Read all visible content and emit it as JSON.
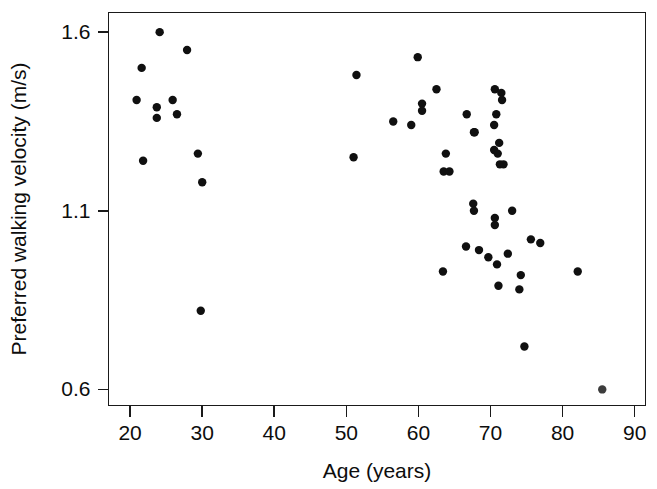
{
  "chart_data": {
    "type": "scatter",
    "title": "",
    "xlabel": "Age (years)",
    "ylabel": "Preferred walking velocity (m/s)",
    "xlim": [
      17.0,
      91.5
    ],
    "ylim": [
      0.555,
      1.655
    ],
    "xticks": [
      20,
      30,
      40,
      50,
      60,
      70,
      80,
      90
    ],
    "xticklabels": [
      "20",
      "30",
      "40",
      "50",
      "60",
      "70",
      "80",
      "90"
    ],
    "yticks": [
      0.6,
      1.1,
      1.6
    ],
    "yticklabels": [
      "0.6",
      "1.1",
      "1.6"
    ],
    "grid": false,
    "legend": null,
    "marker": "filled-circle",
    "marker_color": "#101010",
    "n_points": 55,
    "points": [
      {
        "x": 24.1,
        "y": 1.6
      },
      {
        "x": 27.9,
        "y": 1.55
      },
      {
        "x": 21.6,
        "y": 1.5
      },
      {
        "x": 20.9,
        "y": 1.41
      },
      {
        "x": 23.7,
        "y": 1.39
      },
      {
        "x": 25.9,
        "y": 1.41
      },
      {
        "x": 23.7,
        "y": 1.36
      },
      {
        "x": 26.5,
        "y": 1.37
      },
      {
        "x": 29.4,
        "y": 1.26
      },
      {
        "x": 21.8,
        "y": 1.24
      },
      {
        "x": 30.0,
        "y": 1.18
      },
      {
        "x": 29.8,
        "y": 0.82
      },
      {
        "x": 51.4,
        "y": 1.48
      },
      {
        "x": 51.0,
        "y": 1.25
      },
      {
        "x": 56.5,
        "y": 1.35
      },
      {
        "x": 59.0,
        "y": 1.34
      },
      {
        "x": 59.9,
        "y": 1.53
      },
      {
        "x": 60.5,
        "y": 1.4
      },
      {
        "x": 60.5,
        "y": 1.38
      },
      {
        "x": 62.5,
        "y": 1.44
      },
      {
        "x": 63.8,
        "y": 1.26
      },
      {
        "x": 63.5,
        "y": 1.21
      },
      {
        "x": 64.3,
        "y": 1.21
      },
      {
        "x": 63.4,
        "y": 0.93
      },
      {
        "x": 66.7,
        "y": 1.37
      },
      {
        "x": 67.7,
        "y": 1.32
      },
      {
        "x": 67.8,
        "y": 1.32
      },
      {
        "x": 67.6,
        "y": 1.12
      },
      {
        "x": 67.7,
        "y": 1.1
      },
      {
        "x": 66.6,
        "y": 1.0
      },
      {
        "x": 68.4,
        "y": 0.99
      },
      {
        "x": 70.6,
        "y": 1.44
      },
      {
        "x": 71.5,
        "y": 1.43
      },
      {
        "x": 71.6,
        "y": 1.41
      },
      {
        "x": 70.8,
        "y": 1.37
      },
      {
        "x": 70.5,
        "y": 1.34
      },
      {
        "x": 71.2,
        "y": 1.29
      },
      {
        "x": 70.5,
        "y": 1.27
      },
      {
        "x": 71.0,
        "y": 1.26
      },
      {
        "x": 71.3,
        "y": 1.23
      },
      {
        "x": 71.8,
        "y": 1.23
      },
      {
        "x": 70.6,
        "y": 1.08
      },
      {
        "x": 70.6,
        "y": 1.06
      },
      {
        "x": 69.7,
        "y": 0.97
      },
      {
        "x": 70.9,
        "y": 0.95
      },
      {
        "x": 71.1,
        "y": 0.89
      },
      {
        "x": 72.4,
        "y": 0.98
      },
      {
        "x": 74.2,
        "y": 0.92
      },
      {
        "x": 74.0,
        "y": 0.88
      },
      {
        "x": 74.7,
        "y": 0.72
      },
      {
        "x": 75.6,
        "y": 1.02
      },
      {
        "x": 76.9,
        "y": 1.01
      },
      {
        "x": 82.1,
        "y": 0.93
      },
      {
        "x": 85.5,
        "y": 0.6
      },
      {
        "x": 73.0,
        "y": 1.1
      }
    ]
  },
  "figure": {
    "background_color": "#ffffff",
    "axis_color": "#1a1a1a",
    "text_color": "#0d0d0d"
  }
}
